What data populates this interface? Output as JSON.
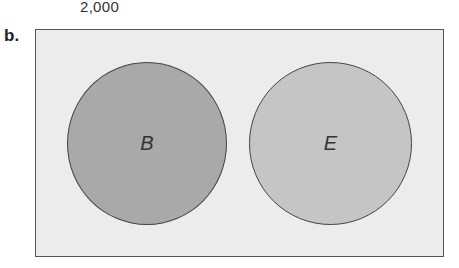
{
  "header": {
    "top_number": "2,000"
  },
  "figure": {
    "part_label": "b.",
    "circles": [
      {
        "label": "B",
        "fill": "#a9a9a9"
      },
      {
        "label": "E",
        "fill": "#c5c5c5"
      }
    ],
    "background_fill": "#ececec"
  }
}
